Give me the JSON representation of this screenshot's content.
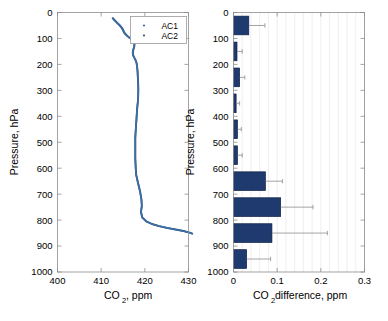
{
  "figure": {
    "name": "co2-vertical-profile-figure",
    "width": 388,
    "height": 321,
    "background": "#ffffff"
  },
  "colors": {
    "curve_ac1": "#3b6ea5",
    "curve_ac2": "#2e4f7a",
    "bar_fill": "#1f3a6e",
    "bar_edge": "#0d1f44",
    "axis": "#8d8d8d",
    "grid": "#e8e8e8",
    "text": "#000000"
  },
  "chart_data": [
    {
      "type": "line",
      "name": "left-panel-co2-profile",
      "title": "",
      "xlabel": "CO_2, ppm",
      "xlabel_base": "CO",
      "xlabel_sub": "2",
      "xlabel_rest": ", ppm",
      "ylabel": "Pressure, hPa",
      "xlim": [
        400,
        430
      ],
      "ylim": [
        0,
        1000
      ],
      "y_inverted": true,
      "xticks": [
        400,
        410,
        420,
        430
      ],
      "xticklabels": [
        "400",
        "410",
        "420",
        "430"
      ],
      "yticks": [
        0,
        100,
        200,
        300,
        400,
        500,
        600,
        700,
        800,
        900,
        1000
      ],
      "yticklabels": [
        "0",
        "100",
        "200",
        "300",
        "400",
        "500",
        "600",
        "700",
        "800",
        "900",
        "1000"
      ],
      "grid": false,
      "legend": {
        "position": "top-right",
        "entries": [
          {
            "label": "AC1",
            "marker": "dot",
            "color": "#3b6ea5"
          },
          {
            "label": "AC2",
            "marker": "dot",
            "color": "#2e4f7a"
          }
        ]
      },
      "series": [
        {
          "name": "AC1",
          "color": "#3b6ea5",
          "x": [
            412.6,
            413.0,
            413.6,
            414.2,
            414.6,
            414.9,
            415.1,
            415.4,
            415.9,
            416.4,
            416.9,
            417.3,
            417.5,
            417.6,
            417.6,
            417.5,
            417.3,
            417.2,
            417.3,
            417.6,
            417.9,
            418.1,
            418.2,
            418.3,
            418.35,
            418.4,
            418.45,
            418.5,
            418.5,
            418.45,
            418.4,
            418.3,
            418.2,
            418.15,
            418.1,
            418.05,
            418.0,
            417.95,
            417.9,
            417.85,
            417.8,
            417.8,
            417.8,
            417.8,
            417.8,
            417.8,
            417.85,
            417.9,
            418.0,
            418.4,
            418.9,
            419.2,
            419.3,
            419.1,
            419.4,
            420.3,
            421.6,
            423.2,
            425.0,
            427.0,
            428.8,
            430.2,
            430.8
          ],
          "y": [
            22,
            30,
            40,
            50,
            58,
            66,
            74,
            82,
            90,
            97,
            103,
            108,
            113,
            120,
            128,
            136,
            145,
            155,
            165,
            175,
            185,
            195,
            208,
            222,
            238,
            255,
            272,
            290,
            308,
            325,
            342,
            358,
            374,
            390,
            404,
            418,
            430,
            442,
            455,
            468,
            482,
            496,
            512,
            528,
            545,
            562,
            580,
            600,
            625,
            655,
            690,
            720,
            745,
            768,
            790,
            805,
            815,
            823,
            830,
            836,
            842,
            848,
            852
          ]
        },
        {
          "name": "AC2",
          "color": "#2e4f7a",
          "x": [
            412.7,
            413.1,
            413.7,
            414.3,
            414.7,
            415.0,
            415.2,
            415.5,
            416.0,
            416.5,
            417.0,
            417.35,
            417.55,
            417.62,
            417.6,
            417.5,
            417.35,
            417.25,
            417.35,
            417.62,
            417.92,
            418.12,
            418.22,
            418.32,
            418.37,
            418.42,
            418.47,
            418.5,
            418.5,
            418.47,
            418.42,
            418.32,
            418.22,
            418.17,
            418.12,
            418.07,
            418.0,
            417.97,
            417.92,
            417.87,
            417.82,
            417.82,
            417.82,
            417.82,
            417.82,
            417.82,
            417.87,
            417.92,
            418.02,
            418.42,
            418.92,
            419.22,
            419.32,
            419.12,
            419.42,
            420.35,
            421.65,
            423.25,
            425.05,
            427.05,
            428.85,
            430.25,
            430.85
          ],
          "y": [
            22,
            30,
            40,
            50,
            58,
            66,
            74,
            82,
            90,
            97,
            103,
            108,
            113,
            120,
            128,
            136,
            145,
            155,
            165,
            175,
            185,
            195,
            208,
            222,
            238,
            255,
            272,
            290,
            308,
            325,
            342,
            358,
            374,
            390,
            404,
            418,
            430,
            442,
            455,
            468,
            482,
            496,
            512,
            528,
            545,
            562,
            580,
            600,
            625,
            655,
            690,
            720,
            745,
            768,
            790,
            805,
            815,
            823,
            830,
            836,
            842,
            848,
            852
          ]
        }
      ]
    },
    {
      "type": "bar",
      "name": "right-panel-co2-difference",
      "orientation": "horizontal",
      "title": "",
      "xlabel": "CO_2 difference, ppm",
      "xlabel_base": "CO",
      "xlabel_sub": "2",
      "xlabel_rest": " difference, ppm",
      "ylabel": "Pressure, hPa",
      "xlim": [
        0,
        0.3
      ],
      "ylim": [
        0,
        1000
      ],
      "y_inverted": true,
      "xticks": [
        0,
        0.1,
        0.2,
        0.3
      ],
      "xticklabels": [
        "0",
        "0.1",
        "0.2",
        "0.3"
      ],
      "yticks": [
        0,
        100,
        200,
        300,
        400,
        500,
        600,
        700,
        800,
        900,
        1000
      ],
      "yticklabels": [
        "0",
        "100",
        "200",
        "300",
        "400",
        "500",
        "600",
        "700",
        "800",
        "900",
        "1000"
      ],
      "grid": true,
      "grid_axis": "x-minor",
      "categories": [
        50,
        150,
        250,
        350,
        450,
        550,
        650,
        750,
        850,
        950
      ],
      "values": [
        0.035,
        0.008,
        0.014,
        0.006,
        0.009,
        0.009,
        0.073,
        0.108,
        0.088,
        0.03
      ],
      "errors": [
        0.072,
        0.02,
        0.026,
        0.014,
        0.018,
        0.02,
        0.112,
        0.182,
        0.215,
        0.085
      ],
      "bar_height_hpa": 72
    }
  ]
}
